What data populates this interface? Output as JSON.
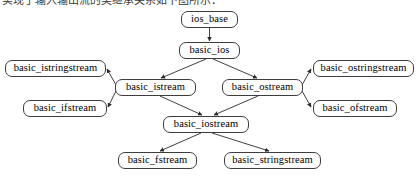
{
  "caption": {
    "text": "实现了输入输出流的类继承关系如下图所示："
  },
  "diagram": {
    "stroke_color": "#3d3d3d",
    "background_color": "#ffffff",
    "text_color": "#000000",
    "nodes": [
      {
        "id": "ios_base",
        "label": "ios_base",
        "x": 181,
        "y": 11,
        "w": 57,
        "h": 17
      },
      {
        "id": "basic_ios",
        "label": "basic_ios",
        "x": 179,
        "y": 42,
        "w": 61,
        "h": 17
      },
      {
        "id": "basic_istringstream",
        "label": "basic_istringstream",
        "x": 5,
        "y": 60,
        "w": 101,
        "h": 17
      },
      {
        "id": "basic_ostringstream",
        "label": "basic_ostringstream",
        "x": 313,
        "y": 60,
        "w": 101,
        "h": 17
      },
      {
        "id": "basic_istream",
        "label": "basic_istream",
        "x": 115,
        "y": 79,
        "w": 81,
        "h": 17
      },
      {
        "id": "basic_ostream",
        "label": "basic_ostream",
        "x": 222,
        "y": 79,
        "w": 81,
        "h": 17
      },
      {
        "id": "basic_ifstream",
        "label": "basic_ifstream",
        "x": 23,
        "y": 100,
        "w": 84,
        "h": 17
      },
      {
        "id": "basic_ofstream",
        "label": "basic_ofstream",
        "x": 313,
        "y": 100,
        "w": 84,
        "h": 17
      },
      {
        "id": "basic_iostream",
        "label": "basic_iostream",
        "x": 163,
        "y": 116,
        "w": 86,
        "h": 17
      },
      {
        "id": "basic_fstream",
        "label": "basic_fstream",
        "x": 118,
        "y": 152,
        "w": 79,
        "h": 17
      },
      {
        "id": "basic_stringstream",
        "label": "basic_stringstream",
        "x": 224,
        "y": 152,
        "w": 97,
        "h": 17
      }
    ],
    "edges": [
      {
        "from": "ios_base",
        "to": "basic_ios",
        "arrow": "end"
      },
      {
        "from": "basic_ios",
        "to": "basic_istream",
        "arrow": "end"
      },
      {
        "from": "basic_ios",
        "to": "basic_ostream",
        "arrow": "end"
      },
      {
        "from": "basic_istream",
        "to": "basic_istringstream",
        "arrow": "end"
      },
      {
        "from": "basic_istream",
        "to": "basic_ifstream",
        "arrow": "end"
      },
      {
        "from": "basic_istream",
        "to": "basic_iostream",
        "arrow": "end"
      },
      {
        "from": "basic_ostream",
        "to": "basic_ostringstream",
        "arrow": "end"
      },
      {
        "from": "basic_ostream",
        "to": "basic_ofstream",
        "arrow": "end"
      },
      {
        "from": "basic_ostream",
        "to": "basic_iostream",
        "arrow": "end"
      },
      {
        "from": "basic_iostream",
        "to": "basic_fstream",
        "arrow": "end"
      },
      {
        "from": "basic_iostream",
        "to": "basic_stringstream",
        "arrow": "end"
      }
    ]
  }
}
